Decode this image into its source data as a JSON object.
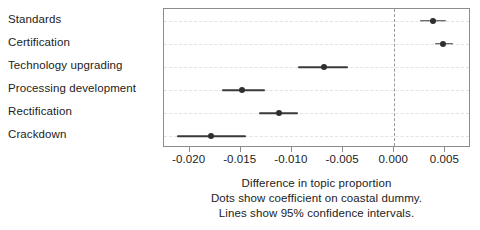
{
  "chart_data": {
    "type": "scatter",
    "orientation": "horizontal",
    "title": "",
    "xlabel": "Difference in topic proportion",
    "ylabel": "",
    "xlim": [
      -0.0225,
      0.0075
    ],
    "xticks": [
      -0.02,
      -0.015,
      -0.01,
      -0.005,
      0.0,
      0.005
    ],
    "xticklabels": [
      "-0.020",
      "-0.015",
      "-0.010",
      "-0.005",
      "0.000",
      "0.005"
    ],
    "grid": "horizontal-dashed",
    "legend": "none",
    "reference_line": 0.0,
    "categories": [
      "Standards",
      "Certification",
      "Technology upgrading",
      "Processing development",
      "Rectification",
      "Crackdown"
    ],
    "values": [
      0.0038,
      0.0048,
      -0.0069,
      -0.0149,
      -0.0113,
      -0.0179
    ],
    "ci_low": [
      0.0025,
      0.004,
      -0.0094,
      -0.0168,
      -0.0132,
      -0.0212
    ],
    "ci_high": [
      0.0051,
      0.0057,
      -0.0045,
      -0.0126,
      -0.0094,
      -0.0145
    ],
    "caption_lines": [
      "Difference in topic proportion",
      "Dots show coefficient on coastal dummy.",
      "Lines show 95% confidence intervals."
    ],
    "colors": {
      "point": "#2f2f2f",
      "line": "#3a3a3a",
      "grid": "#e3e3e3",
      "zero_line": "#9a9a9a",
      "frame": "#8c8c8c",
      "text": "#222222",
      "background": "#ffffff"
    }
  }
}
